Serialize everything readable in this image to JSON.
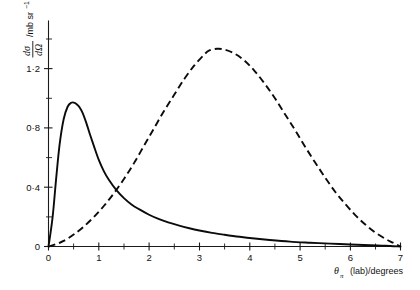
{
  "chart_data": {
    "type": "line",
    "title": "",
    "subtitle": "",
    "xlabel": "θπ (lab)/degrees",
    "xlabel_symbol": "θ",
    "xlabel_subscript": "π",
    "xlabel_rest": "(lab)/degrees",
    "ylabel": "dσ/dΩ /mb sr⁻¹",
    "ylabel_numerator": "dσ",
    "ylabel_denominator": "dΩ",
    "ylabel_units": "/mb sr",
    "ylabel_units_exponent": "−1",
    "xlim": [
      0,
      7
    ],
    "ylim": [
      0,
      1.42
    ],
    "xticks": [
      0,
      1,
      2,
      3,
      4,
      5,
      6,
      7
    ],
    "xticklabels": [
      "0",
      "1",
      "2",
      "3",
      "4",
      "5",
      "6",
      "7"
    ],
    "xminorticks": [
      0.5,
      1.5,
      2.5,
      3.5,
      4.5,
      5.5,
      6.5
    ],
    "yticks": [
      0,
      0.4,
      0.8,
      1.2
    ],
    "yticklabels": [
      "0",
      "0·4",
      "0·8",
      "1·2"
    ],
    "yminorticks": [
      0.2,
      0.6,
      1.0,
      1.4
    ],
    "grid": false,
    "legend": "none",
    "series": [
      {
        "name": "solid-curve",
        "style": "solid",
        "color": "#0b0b0b",
        "x": [
          0.0,
          0.08,
          0.15,
          0.22,
          0.3,
          0.38,
          0.45,
          0.52,
          0.58,
          0.62,
          0.68,
          0.75,
          0.82,
          0.9,
          1.0,
          1.1,
          1.2,
          1.35,
          1.5,
          1.65,
          1.8,
          2.0,
          2.2,
          2.4,
          2.6,
          2.8,
          3.0,
          3.25,
          3.5,
          3.8,
          4.1,
          4.4,
          4.8,
          5.2,
          5.6,
          6.0,
          6.4,
          6.7,
          7.0
        ],
        "y": [
          0.0,
          0.18,
          0.42,
          0.64,
          0.8,
          0.88,
          0.905,
          0.905,
          0.89,
          0.875,
          0.84,
          0.78,
          0.71,
          0.635,
          0.545,
          0.475,
          0.42,
          0.355,
          0.305,
          0.265,
          0.235,
          0.2,
          0.172,
          0.15,
          0.131,
          0.115,
          0.101,
          0.086,
          0.074,
          0.061,
          0.05,
          0.041,
          0.031,
          0.024,
          0.018,
          0.013,
          0.008,
          0.005,
          0.0
        ]
      },
      {
        "name": "dashed-curve",
        "style": "dashed",
        "color": "#0b0b0b",
        "x": [
          0.0,
          0.15,
          0.3,
          0.5,
          0.7,
          0.9,
          1.1,
          1.3,
          1.5,
          1.7,
          1.9,
          2.1,
          2.3,
          2.5,
          2.7,
          2.9,
          3.1,
          3.2,
          3.35,
          3.5,
          3.7,
          3.9,
          4.1,
          4.3,
          4.5,
          4.7,
          4.9,
          5.1,
          5.3,
          5.5,
          5.7,
          5.9,
          6.1,
          6.3,
          6.5,
          6.7,
          6.85,
          7.0
        ],
        "y": [
          0.0,
          0.015,
          0.035,
          0.075,
          0.125,
          0.185,
          0.255,
          0.335,
          0.425,
          0.525,
          0.635,
          0.745,
          0.855,
          0.955,
          1.055,
          1.14,
          1.21,
          1.235,
          1.245,
          1.24,
          1.215,
          1.17,
          1.105,
          1.025,
          0.935,
          0.835,
          0.735,
          0.63,
          0.53,
          0.435,
          0.345,
          0.268,
          0.198,
          0.138,
          0.088,
          0.048,
          0.024,
          0.0
        ]
      }
    ],
    "annotations": []
  },
  "figure": {
    "background_color": "#ffffff",
    "axis_color": "#1a1a1a",
    "curve_color": "#0b0b0b"
  }
}
